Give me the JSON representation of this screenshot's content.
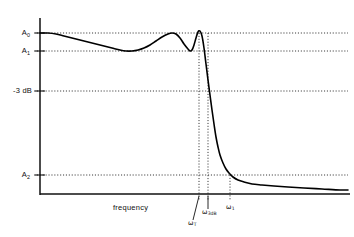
{
  "figure": {
    "title": "",
    "xaxis_title": "frequency",
    "y_labels": [
      {
        "id": "A0",
        "text": "A",
        "subscript": "0",
        "y": 33
      },
      {
        "id": "A1",
        "text": "A",
        "subscript": "1",
        "y": 51
      },
      {
        "id": "m3dB",
        "text": "-3 dB",
        "subscript": "",
        "y": 91
      },
      {
        "id": "A2",
        "text": "A",
        "subscript": "2",
        "y": 175
      }
    ],
    "x_labels": [
      {
        "id": "wT",
        "text": "ω",
        "subscript": "T",
        "x": 192,
        "y": 224
      },
      {
        "id": "w3dB",
        "text": "ω",
        "subscript": "3dB",
        "x": 206,
        "y": 213
      },
      {
        "id": "w1",
        "text": "ω",
        "subscript": "1",
        "x": 228,
        "y": 208
      }
    ],
    "colors": {
      "ink": "#111111",
      "curve": "#000000",
      "guide": "#222222",
      "background": "#ffffff"
    }
  },
  "chart_data": {
    "type": "line",
    "title": "",
    "xlabel": "frequency",
    "ylabel": "",
    "grid": false,
    "legend": null,
    "axis_pixels": {
      "origin_x": 40,
      "origin_y": 194,
      "right_x": 348,
      "top_y": 18
    },
    "reference_levels": [
      {
        "label": "A0",
        "display": "A₀",
        "y_px": 33
      },
      {
        "label": "A1",
        "display": "A₁",
        "y_px": 51
      },
      {
        "label": "-3 dB",
        "display": "-3 dB",
        "y_px": 91
      },
      {
        "label": "A2",
        "display": "A₂",
        "y_px": 175
      }
    ],
    "reference_frequencies": [
      {
        "label": "wT",
        "display": "ωₜ",
        "x_px": 199
      },
      {
        "label": "w3dB",
        "display": "ω₃dB",
        "x_px": 208
      },
      {
        "label": "w1",
        "display": "ω₁",
        "x_px": 230
      }
    ],
    "annotations": [
      "Passband shows equiripple between A0 and A1",
      "Sharp transition band just above omega_T",
      "Stopband tail approaches and crosses A2 level"
    ],
    "series": [
      {
        "name": "amplitude response",
        "points_px": [
          [
            40,
            33
          ],
          [
            48,
            33
          ],
          [
            56,
            34
          ],
          [
            64,
            36
          ],
          [
            72,
            38
          ],
          [
            80,
            40
          ],
          [
            88,
            42
          ],
          [
            96,
            44
          ],
          [
            104,
            46
          ],
          [
            112,
            48
          ],
          [
            120,
            50
          ],
          [
            126,
            51
          ],
          [
            132,
            51
          ],
          [
            138,
            50
          ],
          [
            144,
            48
          ],
          [
            150,
            45
          ],
          [
            156,
            41
          ],
          [
            162,
            37
          ],
          [
            168,
            34
          ],
          [
            172,
            33
          ],
          [
            176,
            34
          ],
          [
            180,
            38
          ],
          [
            184,
            44
          ],
          [
            188,
            49
          ],
          [
            190,
            51
          ],
          [
            192,
            50
          ],
          [
            194,
            45
          ],
          [
            196,
            38
          ],
          [
            198,
            32
          ],
          [
            200,
            31
          ],
          [
            202,
            36
          ],
          [
            204,
            48
          ],
          [
            206,
            64
          ],
          [
            208,
            80
          ],
          [
            210,
            95
          ],
          [
            212,
            110
          ],
          [
            214,
            124
          ],
          [
            216,
            137
          ],
          [
            218,
            147
          ],
          [
            220,
            155
          ],
          [
            223,
            163
          ],
          [
            226,
            169
          ],
          [
            229,
            173
          ],
          [
            233,
            177
          ],
          [
            238,
            180
          ],
          [
            244,
            182
          ],
          [
            252,
            184
          ],
          [
            262,
            185
          ],
          [
            274,
            186
          ],
          [
            288,
            187
          ],
          [
            304,
            188
          ],
          [
            322,
            189
          ],
          [
            340,
            190
          ],
          [
            348,
            190
          ]
        ]
      }
    ]
  }
}
